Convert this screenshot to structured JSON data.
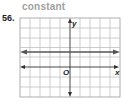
{
  "exercise": {
    "number": "56.",
    "answer": "constant"
  },
  "graph": {
    "x_label": "x",
    "y_label": "y",
    "origin_label": "O",
    "grid_columns": 10,
    "grid_rows": 8,
    "line": {
      "type": "horizontal",
      "y": 1.5
    }
  },
  "colors": {
    "grid": "#b8b8b8",
    "axis": "#333333",
    "line": "#555555",
    "title": "#a0a0a0"
  }
}
